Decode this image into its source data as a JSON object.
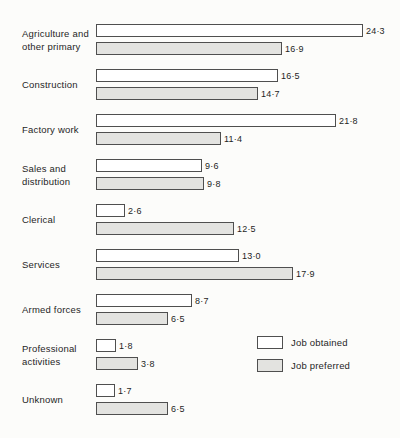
{
  "figure": {
    "background": "#fcfcfa"
  },
  "chart_data": {
    "type": "bar",
    "orientation": "horizontal",
    "title": "",
    "xlabel": "",
    "ylabel": "",
    "xlim": [
      0,
      25
    ],
    "grid": false,
    "legend_position": "bottom-right",
    "decimal_separator": "·",
    "categories": [
      {
        "label": "Agriculture and other primary",
        "lines": [
          "Agriculture and",
          "other primary"
        ]
      },
      {
        "label": "Construction",
        "lines": [
          "Construction"
        ]
      },
      {
        "label": "Factory work",
        "lines": [
          "Factory work"
        ]
      },
      {
        "label": "Sales and distribution",
        "lines": [
          "Sales and",
          "distribution"
        ]
      },
      {
        "label": "Clerical",
        "lines": [
          "Clerical"
        ]
      },
      {
        "label": "Services",
        "lines": [
          "Services"
        ]
      },
      {
        "label": "Armed forces",
        "lines": [
          "Armed forces"
        ]
      },
      {
        "label": "Professional activities",
        "lines": [
          "Professional",
          "activities"
        ]
      },
      {
        "label": "Unknown",
        "lines": [
          "Unknown"
        ]
      }
    ],
    "series": [
      {
        "name": "Job obtained",
        "fill": "#ffffff",
        "values": [
          24.3,
          16.5,
          21.8,
          9.6,
          2.6,
          13.0,
          8.7,
          1.8,
          1.7
        ],
        "value_labels": [
          "24·3",
          "16·5",
          "21·8",
          "9·6",
          "2·6",
          "13·0",
          "8·7",
          "1·8",
          "1·7"
        ]
      },
      {
        "name": "Job preferred",
        "fill": "#e3e3e0",
        "values": [
          16.9,
          14.7,
          11.4,
          9.8,
          12.5,
          17.9,
          6.5,
          3.8,
          6.5
        ],
        "value_labels": [
          "16·9",
          "14·7",
          "11·4",
          "9·8",
          "12·5",
          "17·9",
          "6·5",
          "3·8",
          "6·5"
        ]
      }
    ],
    "colors": {
      "bar_border": "#4f4f4f",
      "text": "#1f1f1f"
    }
  }
}
